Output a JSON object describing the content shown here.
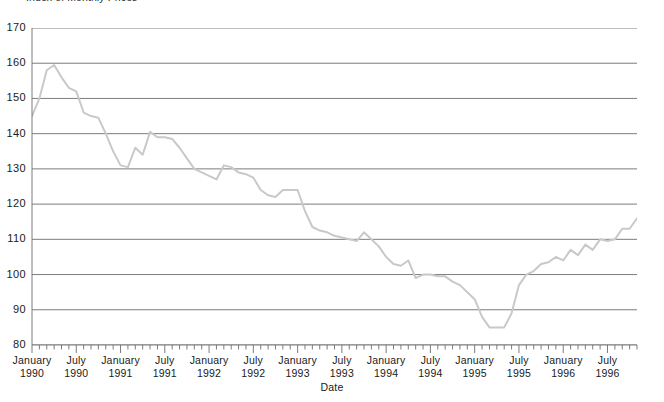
{
  "figure": {
    "clipped_top_text": "Index of Monthly Prices",
    "line_color": "#c9c9c9",
    "grid_color": "#6e6e6e",
    "axis_color": "#6e6e6e",
    "background": "#ffffff"
  },
  "chart_data": {
    "type": "line",
    "title": "",
    "xlabel": "Date",
    "ylabel": "",
    "ylim": [
      80,
      170
    ],
    "ytick_values": [
      170,
      160,
      150,
      140,
      130,
      120,
      110,
      100,
      90,
      80
    ],
    "ytick_labels": [
      "170",
      "160",
      "150",
      "140",
      "130",
      "120",
      "110",
      "100",
      "90",
      "80"
    ],
    "grid": true,
    "grid_axis": "y",
    "legend": "none",
    "xtick_major_labels": [
      {
        "line1": "January",
        "line2": "1990"
      },
      {
        "line1": "July",
        "line2": "1990"
      },
      {
        "line1": "January",
        "line2": "1991"
      },
      {
        "line1": "July",
        "line2": "1991"
      },
      {
        "line1": "January",
        "line2": "1992"
      },
      {
        "line1": "July",
        "line2": "1992"
      },
      {
        "line1": "January",
        "line2": "1993"
      },
      {
        "line1": "July",
        "line2": "1993"
      },
      {
        "line1": "January",
        "line2": "1994"
      },
      {
        "line1": "July",
        "line2": "1994"
      },
      {
        "line1": "January",
        "line2": "1995"
      },
      {
        "line1": "July",
        "line2": "1995"
      },
      {
        "line1": "January",
        "line2": "1996"
      },
      {
        "line1": "July",
        "line2": "1996"
      }
    ],
    "x_minor_tick_interval": "1 month",
    "x_major_tick_interval": "6 months",
    "x": [
      "1990-01",
      "1990-02",
      "1990-03",
      "1990-04",
      "1990-05",
      "1990-06",
      "1990-07",
      "1990-08",
      "1990-09",
      "1990-10",
      "1990-11",
      "1990-12",
      "1991-01",
      "1991-02",
      "1991-03",
      "1991-04",
      "1991-05",
      "1991-06",
      "1991-07",
      "1991-08",
      "1991-09",
      "1991-10",
      "1991-11",
      "1991-12",
      "1992-01",
      "1992-02",
      "1992-03",
      "1992-04",
      "1992-05",
      "1992-06",
      "1992-07",
      "1992-08",
      "1992-09",
      "1992-10",
      "1992-11",
      "1992-12",
      "1993-01",
      "1993-02",
      "1993-03",
      "1993-04",
      "1993-05",
      "1993-06",
      "1993-07",
      "1993-08",
      "1993-09",
      "1993-10",
      "1993-11",
      "1993-12",
      "1994-01",
      "1994-02",
      "1994-03",
      "1994-04",
      "1994-05",
      "1994-06",
      "1994-07",
      "1994-08",
      "1994-09",
      "1994-10",
      "1994-11",
      "1994-12",
      "1995-01",
      "1995-02",
      "1995-03",
      "1995-04",
      "1995-05",
      "1995-06",
      "1995-07",
      "1995-08",
      "1995-09",
      "1995-10",
      "1995-11",
      "1995-12",
      "1996-01",
      "1996-02",
      "1996-03",
      "1996-04",
      "1996-05",
      "1996-06",
      "1996-07",
      "1996-08",
      "1996-09",
      "1996-10",
      "1996-11"
    ],
    "values": [
      145,
      150,
      158,
      159.5,
      156,
      153,
      152,
      146,
      145,
      144.5,
      140,
      135,
      131,
      130.5,
      136,
      134,
      140.5,
      139,
      139,
      138.5,
      136,
      133,
      130,
      129,
      128,
      127,
      131,
      130.5,
      129,
      128.5,
      127.5,
      124,
      122.5,
      122,
      124,
      124,
      124,
      118,
      113.5,
      112.5,
      112,
      111,
      110.5,
      110,
      109.5,
      112,
      110,
      108,
      105,
      103,
      102.5,
      104,
      99,
      100,
      100,
      99.5,
      99.5,
      98,
      97,
      95,
      93,
      88,
      85,
      85,
      85,
      89,
      97,
      100,
      101,
      103,
      103.5,
      105,
      104,
      107,
      105.5,
      108.5,
      107,
      110,
      109.5,
      110,
      113,
      113,
      116
    ]
  }
}
